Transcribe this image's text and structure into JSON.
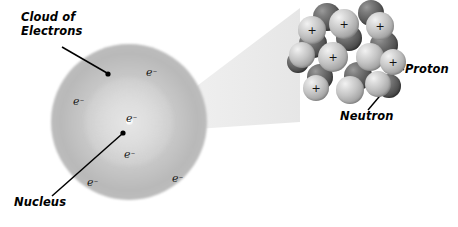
{
  "figure": {
    "background_color": "#ffffff"
  },
  "labels": {
    "cloud_of_electrons": "Cloud of\nElectrons",
    "nucleus": "Nucleus",
    "proton": "Proton",
    "neutron": "Neutron"
  },
  "electrons": [
    {
      "text": "e",
      "charge": "–",
      "x": 146,
      "y": 66
    },
    {
      "text": "e",
      "charge": "–",
      "x": 73,
      "y": 95
    },
    {
      "text": "e",
      "charge": "–",
      "x": 126,
      "y": 112
    },
    {
      "text": "e",
      "charge": "–",
      "x": 124,
      "y": 148
    },
    {
      "text": "e",
      "charge": "–",
      "x": 87,
      "y": 176
    },
    {
      "text": "e",
      "charge": "–",
      "x": 172,
      "y": 172
    }
  ],
  "electron_cloud": {
    "center_x": 129,
    "center_y": 122,
    "radius": 78,
    "nucleus_dot_x": 129,
    "nucleus_dot_y": 122,
    "fill_description": "soft grey radial gradient sphere"
  },
  "magnification_cone": {
    "apex_x": 150,
    "apex_y": 126,
    "color": "#ededed",
    "description": "light grey wedge expanding from atom center to nucleus close-up"
  },
  "nucleus_closeup": {
    "center_x": 348,
    "center_y": 60,
    "proton_symbol": "+",
    "proton_color": "#c4c4c4",
    "neutron_color": "#4a4a4a",
    "nucleons": [
      {
        "type": "neutron",
        "x": 327,
        "y": 17,
        "r": 14
      },
      {
        "type": "neutron",
        "x": 371,
        "y": 13,
        "r": 13
      },
      {
        "type": "neutron",
        "x": 313,
        "y": 44,
        "r": 14
      },
      {
        "type": "neutron",
        "x": 349,
        "y": 38,
        "r": 13
      },
      {
        "type": "neutron",
        "x": 384,
        "y": 45,
        "r": 14
      },
      {
        "type": "neutron",
        "x": 320,
        "y": 77,
        "r": 13
      },
      {
        "type": "neutron",
        "x": 358,
        "y": 76,
        "r": 14
      },
      {
        "type": "neutron",
        "x": 389,
        "y": 86,
        "r": 12
      },
      {
        "type": "neutron",
        "x": 301,
        "y": 62,
        "r": 11
      },
      {
        "type": "proton",
        "x": 312,
        "y": 30,
        "r": 14,
        "charge": "+"
      },
      {
        "type": "proton",
        "x": 344,
        "y": 24,
        "r": 15,
        "charge": "+"
      },
      {
        "type": "proton",
        "x": 380,
        "y": 26,
        "r": 14,
        "charge": "+"
      },
      {
        "type": "proton",
        "x": 302,
        "y": 55,
        "r": 13
      },
      {
        "type": "proton",
        "x": 333,
        "y": 57,
        "r": 15,
        "charge": "+"
      },
      {
        "type": "proton",
        "x": 370,
        "y": 57,
        "r": 14
      },
      {
        "type": "proton",
        "x": 393,
        "y": 62,
        "r": 13,
        "charge": "+"
      },
      {
        "type": "proton",
        "x": 316,
        "y": 88,
        "r": 13,
        "charge": "+"
      },
      {
        "type": "proton",
        "x": 350,
        "y": 90,
        "r": 14
      },
      {
        "type": "proton",
        "x": 378,
        "y": 84,
        "r": 13
      }
    ]
  }
}
